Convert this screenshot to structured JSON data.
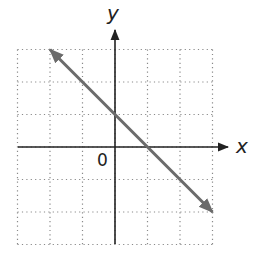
{
  "chart_data": {
    "type": "line",
    "title": "",
    "xlabel": "x",
    "ylabel": "y",
    "origin_label": "0",
    "xlim": [
      -3,
      3
    ],
    "ylim": [
      -3,
      3
    ],
    "grid": true,
    "grid_style": "dotted",
    "tick_labels_shown": false,
    "series": [
      {
        "name": "line",
        "equation": "y = -x + 1",
        "slope": -1,
        "y_intercept": 1,
        "x_intercept": 1,
        "x": [
          -2,
          3
        ],
        "y": [
          3,
          -2
        ],
        "arrows_both_ends": true,
        "color": "#6b6b6b"
      }
    ],
    "legend": null
  },
  "colors": {
    "axis": "#222222",
    "grid": "#8a8a8a",
    "line": "#6b6b6b",
    "background": "#ffffff"
  }
}
